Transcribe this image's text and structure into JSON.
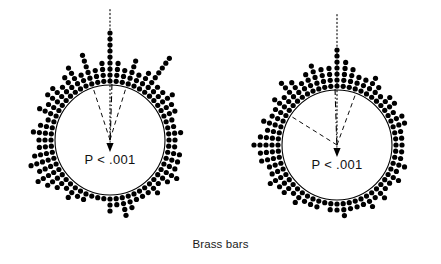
{
  "figure": {
    "caption": "Brass bars",
    "background_color": "#ffffff",
    "ink_color": "#000000",
    "width": 441,
    "height": 264
  },
  "chart_data": {
    "type": "scatter",
    "subtype": "circular-dot-diagram",
    "title": "Brass bars",
    "xlabel": "",
    "ylabel": "",
    "legend_position": "none",
    "grid": false,
    "units": "degrees",
    "axis_range_deg": [
      0,
      360
    ],
    "panels": [
      {
        "name": "left-panel",
        "label": "P < .001",
        "significance_label": "P < .001",
        "center": {
          "x": 110,
          "y": 140
        },
        "radius": 55,
        "dot_radius": 2.6,
        "dot_spacing": 6.0,
        "reference_line": {
          "style": "dotted",
          "angle_deg": 90,
          "length": 132,
          "label": ""
        },
        "mean_vector": {
          "style": "dash-dot",
          "angle_deg": 268,
          "length": 56,
          "arrowhead": true
        },
        "confidence_interval": {
          "style": "dashed",
          "lower_deg": 73,
          "upper_deg": 108
        },
        "bins": [
          {
            "angle_deg": 90,
            "count": 9
          },
          {
            "angle_deg": 84,
            "count": 4
          },
          {
            "angle_deg": 96,
            "count": 4
          },
          {
            "angle_deg": 78,
            "count": 3
          },
          {
            "angle_deg": 102,
            "count": 3
          },
          {
            "angle_deg": 72,
            "count": 5
          },
          {
            "angle_deg": 108,
            "count": 6
          },
          {
            "angle_deg": 66,
            "count": 3
          },
          {
            "angle_deg": 114,
            "count": 3
          },
          {
            "angle_deg": 60,
            "count": 4
          },
          {
            "angle_deg": 120,
            "count": 5
          },
          {
            "angle_deg": 54,
            "count": 8
          },
          {
            "angle_deg": 126,
            "count": 4
          },
          {
            "angle_deg": 48,
            "count": 3
          },
          {
            "angle_deg": 132,
            "count": 3
          },
          {
            "angle_deg": 42,
            "count": 3
          },
          {
            "angle_deg": 138,
            "count": 4
          },
          {
            "angle_deg": 36,
            "count": 4
          },
          {
            "angle_deg": 144,
            "count": 4
          },
          {
            "angle_deg": 30,
            "count": 3
          },
          {
            "angle_deg": 150,
            "count": 3
          },
          {
            "angle_deg": 24,
            "count": 3
          },
          {
            "angle_deg": 156,
            "count": 4
          },
          {
            "angle_deg": 18,
            "count": 2
          },
          {
            "angle_deg": 162,
            "count": 2
          },
          {
            "angle_deg": 12,
            "count": 2
          },
          {
            "angle_deg": 168,
            "count": 3
          },
          {
            "angle_deg": 6,
            "count": 3
          },
          {
            "angle_deg": 174,
            "count": 4
          },
          {
            "angle_deg": 0,
            "count": 2
          },
          {
            "angle_deg": 180,
            "count": 3
          },
          {
            "angle_deg": 354,
            "count": 2
          },
          {
            "angle_deg": 186,
            "count": 3
          },
          {
            "angle_deg": 348,
            "count": 3
          },
          {
            "angle_deg": 192,
            "count": 4
          },
          {
            "angle_deg": 342,
            "count": 3
          },
          {
            "angle_deg": 198,
            "count": 5
          },
          {
            "angle_deg": 336,
            "count": 3
          },
          {
            "angle_deg": 204,
            "count": 4
          },
          {
            "angle_deg": 330,
            "count": 4
          },
          {
            "angle_deg": 210,
            "count": 5
          },
          {
            "angle_deg": 324,
            "count": 3
          },
          {
            "angle_deg": 216,
            "count": 4
          },
          {
            "angle_deg": 318,
            "count": 2
          },
          {
            "angle_deg": 222,
            "count": 3
          },
          {
            "angle_deg": 312,
            "count": 3
          },
          {
            "angle_deg": 228,
            "count": 2
          },
          {
            "angle_deg": 306,
            "count": 2
          },
          {
            "angle_deg": 234,
            "count": 3
          },
          {
            "angle_deg": 300,
            "count": 2
          },
          {
            "angle_deg": 240,
            "count": 2
          },
          {
            "angle_deg": 294,
            "count": 2
          },
          {
            "angle_deg": 246,
            "count": 2
          },
          {
            "angle_deg": 288,
            "count": 3
          },
          {
            "angle_deg": 252,
            "count": 1
          },
          {
            "angle_deg": 282,
            "count": 4
          },
          {
            "angle_deg": 258,
            "count": 1
          },
          {
            "angle_deg": 276,
            "count": 2
          },
          {
            "angle_deg": 264,
            "count": 1
          },
          {
            "angle_deg": 270,
            "count": 3
          }
        ]
      },
      {
        "name": "right-panel",
        "label": "P < .001",
        "significance_label": "P < .001",
        "center": {
          "x": 337,
          "y": 145
        },
        "radius": 55,
        "dot_radius": 2.6,
        "dot_spacing": 6.0,
        "reference_line": {
          "style": "dotted",
          "angle_deg": 90,
          "length": 132,
          "label": ""
        },
        "mean_vector": {
          "style": "dash-dot",
          "angle_deg": 272,
          "length": 56,
          "arrowhead": true
        },
        "confidence_interval": {
          "style": "dashed",
          "lower_deg": 70,
          "upper_deg": 148
        },
        "bins": [
          {
            "angle_deg": 90,
            "count": 7
          },
          {
            "angle_deg": 84,
            "count": 5
          },
          {
            "angle_deg": 96,
            "count": 4
          },
          {
            "angle_deg": 78,
            "count": 4
          },
          {
            "angle_deg": 102,
            "count": 4
          },
          {
            "angle_deg": 72,
            "count": 3
          },
          {
            "angle_deg": 108,
            "count": 5
          },
          {
            "angle_deg": 66,
            "count": 3
          },
          {
            "angle_deg": 114,
            "count": 4
          },
          {
            "angle_deg": 60,
            "count": 4
          },
          {
            "angle_deg": 120,
            "count": 3
          },
          {
            "angle_deg": 54,
            "count": 3
          },
          {
            "angle_deg": 126,
            "count": 4
          },
          {
            "angle_deg": 48,
            "count": 2
          },
          {
            "angle_deg": 132,
            "count": 5
          },
          {
            "angle_deg": 42,
            "count": 3
          },
          {
            "angle_deg": 138,
            "count": 3
          },
          {
            "angle_deg": 36,
            "count": 3
          },
          {
            "angle_deg": 144,
            "count": 4
          },
          {
            "angle_deg": 30,
            "count": 2
          },
          {
            "angle_deg": 150,
            "count": 3
          },
          {
            "angle_deg": 24,
            "count": 3
          },
          {
            "angle_deg": 156,
            "count": 3
          },
          {
            "angle_deg": 18,
            "count": 3
          },
          {
            "angle_deg": 162,
            "count": 4
          },
          {
            "angle_deg": 12,
            "count": 2
          },
          {
            "angle_deg": 168,
            "count": 3
          },
          {
            "angle_deg": 6,
            "count": 2
          },
          {
            "angle_deg": 174,
            "count": 4
          },
          {
            "angle_deg": 0,
            "count": 2
          },
          {
            "angle_deg": 180,
            "count": 5
          },
          {
            "angle_deg": 354,
            "count": 2
          },
          {
            "angle_deg": 186,
            "count": 4
          },
          {
            "angle_deg": 348,
            "count": 2
          },
          {
            "angle_deg": 192,
            "count": 4
          },
          {
            "angle_deg": 342,
            "count": 3
          },
          {
            "angle_deg": 198,
            "count": 3
          },
          {
            "angle_deg": 336,
            "count": 2
          },
          {
            "angle_deg": 204,
            "count": 3
          },
          {
            "angle_deg": 330,
            "count": 3
          },
          {
            "angle_deg": 210,
            "count": 4
          },
          {
            "angle_deg": 324,
            "count": 2
          },
          {
            "angle_deg": 216,
            "count": 3
          },
          {
            "angle_deg": 318,
            "count": 2
          },
          {
            "angle_deg": 222,
            "count": 3
          },
          {
            "angle_deg": 312,
            "count": 3
          },
          {
            "angle_deg": 228,
            "count": 2
          },
          {
            "angle_deg": 306,
            "count": 2
          },
          {
            "angle_deg": 234,
            "count": 3
          },
          {
            "angle_deg": 300,
            "count": 3
          },
          {
            "angle_deg": 240,
            "count": 2
          },
          {
            "angle_deg": 294,
            "count": 2
          },
          {
            "angle_deg": 246,
            "count": 2
          },
          {
            "angle_deg": 288,
            "count": 2
          },
          {
            "angle_deg": 252,
            "count": 2
          },
          {
            "angle_deg": 282,
            "count": 2
          },
          {
            "angle_deg": 258,
            "count": 1
          },
          {
            "angle_deg": 276,
            "count": 3
          },
          {
            "angle_deg": 264,
            "count": 2
          },
          {
            "angle_deg": 270,
            "count": 2
          }
        ]
      }
    ]
  }
}
